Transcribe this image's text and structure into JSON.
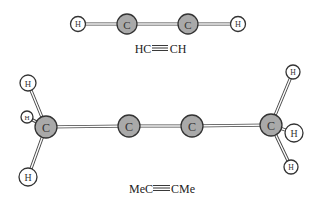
{
  "molecules": [
    {
      "name": "ethyne",
      "formula_left": "HC",
      "formula_right": "CH",
      "formula_bond": "triple",
      "atoms": [
        {
          "id": "H1",
          "label": "H",
          "element": "H",
          "x": 78,
          "y": 24,
          "r": 7.5
        },
        {
          "id": "C1",
          "label": "C",
          "element": "C",
          "x": 127,
          "y": 24,
          "r": 10
        },
        {
          "id": "C2",
          "label": "C",
          "element": "C",
          "x": 188,
          "y": 24,
          "r": 10
        },
        {
          "id": "H2",
          "label": "H",
          "element": "H",
          "x": 238,
          "y": 24,
          "r": 7.5
        }
      ],
      "bonds": [
        [
          "H1",
          "C1"
        ],
        [
          "C1",
          "C2"
        ],
        [
          "C2",
          "H2"
        ]
      ]
    },
    {
      "name": "but-2-yne",
      "formula_left": "MeC",
      "formula_right": "CMe",
      "formula_bond": "triple",
      "atoms": [
        {
          "id": "Ha",
          "label": "H",
          "element": "H",
          "x": 28,
          "y": 83,
          "r": 8
        },
        {
          "id": "Hb",
          "label": "H",
          "element": "H",
          "x": 27,
          "y": 117,
          "r": 6
        },
        {
          "id": "Hc",
          "label": "H",
          "element": "H",
          "x": 28,
          "y": 177,
          "r": 9
        },
        {
          "id": "Ca",
          "label": "C",
          "element": "C",
          "x": 46,
          "y": 127,
          "r": 11
        },
        {
          "id": "Cb",
          "label": "C",
          "element": "C",
          "x": 129,
          "y": 126,
          "r": 11
        },
        {
          "id": "Cc",
          "label": "C",
          "element": "C",
          "x": 192,
          "y": 126,
          "r": 11
        },
        {
          "id": "Cd",
          "label": "C",
          "element": "C",
          "x": 271,
          "y": 125,
          "r": 11
        },
        {
          "id": "Hd",
          "label": "H",
          "element": "H",
          "x": 293,
          "y": 72,
          "r": 7
        },
        {
          "id": "He",
          "label": "H",
          "element": "H",
          "x": 294,
          "y": 133,
          "r": 9
        },
        {
          "id": "Hf",
          "label": "H",
          "element": "H",
          "x": 291,
          "y": 167,
          "r": 7
        }
      ],
      "bonds": [
        [
          "Ca",
          "Ha"
        ],
        [
          "Ca",
          "Hb"
        ],
        [
          "Ca",
          "Hc"
        ],
        [
          "Ca",
          "Cb"
        ],
        [
          "Cb",
          "Cc"
        ],
        [
          "Cc",
          "Cd"
        ],
        [
          "Cd",
          "Hd"
        ],
        [
          "Cd",
          "He"
        ],
        [
          "Cd",
          "Hf"
        ]
      ]
    }
  ],
  "labels": {
    "formula1": {
      "left": "HC",
      "right": "CH"
    },
    "formula2": {
      "left": "MeC",
      "right": "CMe"
    }
  },
  "colors": {
    "carbon_fill": "#a9a9a9",
    "hydrogen_fill": "#ffffff",
    "outline": "#333333"
  }
}
